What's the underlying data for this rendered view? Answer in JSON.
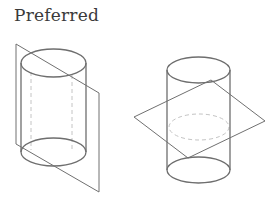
{
  "title": "Preferred",
  "figures": [
    {
      "id": "left",
      "description": "Vertical cylinder cut by a vertical slanted cutting plane",
      "cylinder": {
        "cx": 53.5,
        "rx": 32.5,
        "ry": 14,
        "top_y": 63,
        "bottom_y": 152
      },
      "plane": [
        [
          16,
          44
        ],
        [
          99,
          93
        ],
        [
          99,
          192
        ],
        [
          16,
          144
        ]
      ],
      "hidden_lines_x": [
        31,
        72
      ]
    },
    {
      "id": "right",
      "description": "Vertical cylinder cut by a horizontal cutting plane",
      "cylinder": {
        "cx": 198.5,
        "rx": 31.5,
        "ry": 13,
        "top_y": 70,
        "bottom_y": 170
      },
      "plane": [
        [
          134,
          117
        ],
        [
          211,
          80
        ],
        [
          265,
          121
        ],
        [
          188,
          158
        ]
      ],
      "hidden_ellipse": {
        "cx": 199,
        "cy": 127,
        "rx": 30,
        "ry": 13
      }
    }
  ],
  "colors": {
    "line": "#6e6e6e",
    "hidden": "#c4c4c4",
    "text": "#3a3a3a"
  }
}
